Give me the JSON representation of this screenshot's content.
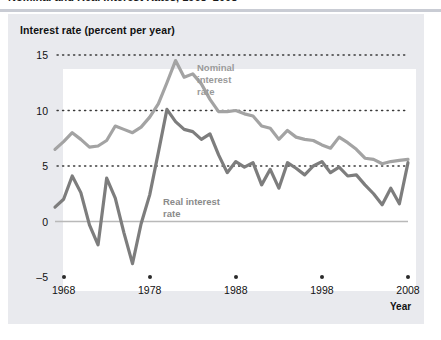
{
  "figure": {
    "title": "Nominal and Real Interest Rates, 1968–2008",
    "axis_title": "Interest rate (percent per year)",
    "xaxis_name": "Year"
  },
  "annotations": {
    "nominal": "Nominal\ninterest\nrate",
    "real": "Real interest\nrate"
  },
  "colors": {
    "nominal_line": "#a3a3a3",
    "real_line": "#7d7d7d",
    "panel": "#e9eaee",
    "plot_bg": "#ffffff",
    "gridline": "#3a3a3a",
    "zero_line": "#b9b9b9",
    "tick_dot": "#2b2b2b",
    "text": "#111111",
    "annotation_text": "#9a9a9a",
    "title_rule": "#c9ccd4"
  },
  "chart_data": {
    "type": "line",
    "title": "Nominal and Real Interest Rates, 1968–2008",
    "xlabel": "Year",
    "ylabel": "Interest rate (percent per year)",
    "xlim": [
      1967,
      2008
    ],
    "ylim": [
      -5,
      15
    ],
    "xticks": [
      1968,
      1978,
      1988,
      1998,
      2008
    ],
    "yticks": [
      -5,
      0,
      5,
      10,
      15
    ],
    "grid": "horizontal dotted at 5, 10, 15; solid light line at 0",
    "legend": "inline annotations",
    "x": [
      1967,
      1968,
      1969,
      1970,
      1971,
      1972,
      1973,
      1974,
      1975,
      1976,
      1977,
      1978,
      1979,
      1980,
      1981,
      1982,
      1983,
      1984,
      1985,
      1986,
      1987,
      1988,
      1989,
      1990,
      1991,
      1992,
      1993,
      1994,
      1995,
      1996,
      1997,
      1998,
      1999,
      2000,
      2001,
      2002,
      2003,
      2004,
      2005,
      2006,
      2007,
      2008
    ],
    "series": [
      {
        "name": "Nominal interest rate",
        "color": "#a3a3a3",
        "values": [
          6.5,
          7.2,
          8.0,
          7.4,
          6.7,
          6.8,
          7.3,
          8.6,
          8.3,
          8.0,
          8.5,
          9.4,
          10.6,
          12.5,
          14.5,
          13.0,
          13.3,
          12.4,
          11.0,
          9.9,
          9.9,
          10.0,
          9.7,
          9.5,
          8.6,
          8.4,
          7.4,
          8.2,
          7.6,
          7.4,
          7.3,
          6.9,
          6.6,
          7.6,
          7.1,
          6.5,
          5.7,
          5.6,
          5.2,
          5.4,
          5.5,
          5.6
        ]
      },
      {
        "name": "Real interest rate",
        "color": "#7d7d7d",
        "values": [
          1.3,
          2.0,
          4.1,
          2.6,
          -0.3,
          -2.1,
          3.9,
          2.1,
          -1.0,
          -3.8,
          -0.2,
          2.4,
          6.2,
          10.1,
          9.0,
          8.3,
          8.1,
          7.4,
          7.9,
          6.0,
          4.4,
          5.4,
          4.9,
          5.3,
          3.3,
          4.7,
          3.0,
          5.3,
          4.8,
          4.2,
          5.0,
          5.4,
          4.4,
          4.9,
          4.1,
          4.2,
          3.3,
          2.5,
          1.5,
          3.0,
          1.6,
          5.3
        ]
      }
    ]
  }
}
